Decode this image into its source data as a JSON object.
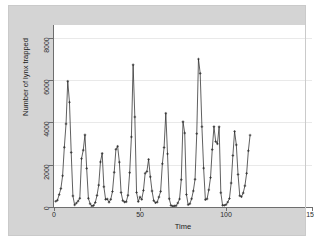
{
  "chart_data": {
    "type": "line",
    "title": "",
    "xlabel": "Time",
    "ylabel": "Number of lynx trapped",
    "xlim": [
      0,
      150
    ],
    "ylim": [
      0,
      8600
    ],
    "xticks": [
      0,
      50,
      100,
      150
    ],
    "yticks": [
      0,
      2000,
      4000,
      6000,
      8000
    ],
    "xtick_labels": [
      "0",
      "50",
      "100",
      "150"
    ],
    "ytick_labels": [
      "0",
      "2000",
      "4000",
      "6000",
      "8000"
    ],
    "grid": true,
    "gridlines_y": [
      0,
      2000,
      4000,
      6000,
      8000
    ],
    "legend": "none",
    "markers": "plus",
    "line_color": "#2b2b2b",
    "marker_color": "#2b2b2b",
    "plot_background": "#ffffff",
    "panel_background": "#d4d4d4",
    "grid_color": "#e9e9e9",
    "axis_color": "#6e6e6e",
    "series": [
      {
        "name": "lynx",
        "x": [
          1,
          2,
          3,
          4,
          5,
          6,
          7,
          8,
          9,
          10,
          11,
          12,
          13,
          14,
          15,
          16,
          17,
          18,
          19,
          20,
          21,
          22,
          23,
          24,
          25,
          26,
          27,
          28,
          29,
          30,
          31,
          32,
          33,
          34,
          35,
          36,
          37,
          38,
          39,
          40,
          41,
          42,
          43,
          44,
          45,
          46,
          47,
          48,
          49,
          50,
          51,
          52,
          53,
          54,
          55,
          56,
          57,
          58,
          59,
          60,
          61,
          62,
          63,
          64,
          65,
          66,
          67,
          68,
          69,
          70,
          71,
          72,
          73,
          74,
          75,
          76,
          77,
          78,
          79,
          80,
          81,
          82,
          83,
          84,
          85,
          86,
          87,
          88,
          89,
          90,
          91,
          92,
          93,
          94,
          95,
          96,
          97,
          98,
          99,
          100,
          101,
          102,
          103,
          104,
          105,
          106,
          107,
          108,
          109,
          110,
          111,
          112,
          113,
          114
        ],
        "values": [
          269,
          321,
          585,
          871,
          1475,
          2821,
          3928,
          5943,
          4950,
          2577,
          523,
          98,
          184,
          279,
          409,
          2285,
          2685,
          3409,
          1824,
          409,
          151,
          45,
          68,
          213,
          546,
          1033,
          2129,
          2536,
          957,
          361,
          377,
          225,
          360,
          731,
          1638,
          2725,
          2871,
          2119,
          684,
          299,
          236,
          245,
          552,
          1623,
          3311,
          6721,
          4254,
          687,
          255,
          473,
          358,
          784,
          1594,
          1676,
          2251,
          1426,
          756,
          299,
          201,
          229,
          469,
          736,
          2042,
          2811,
          4431,
          2511,
          389,
          73,
          39,
          49,
          59,
          188,
          377,
          1292,
          4031,
          3495,
          587,
          105,
          153,
          387,
          758,
          1307,
          3465,
          6991,
          6313,
          3794,
          1836,
          345,
          382,
          808,
          1388,
          2713,
          3800,
          3091,
          2985,
          3790,
          674,
          81,
          80,
          108,
          229,
          399,
          1132,
          2432,
          3574,
          2935,
          1537,
          529,
          485,
          662,
          1000,
          1590,
          2657,
          3396
        ]
      }
    ]
  },
  "axes": {
    "y_title": "Number of lynx trapped",
    "x_title": "Time"
  }
}
